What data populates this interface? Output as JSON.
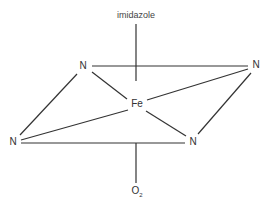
{
  "diagram": {
    "labels": {
      "top_ligand": "imidazole",
      "center": "Fe",
      "n_top_left": "N",
      "n_top_right": "N",
      "n_bottom_left": "N",
      "n_bottom_right": "N",
      "bottom_ligand_base": "O",
      "bottom_ligand_sub": "2"
    },
    "line_color": "#333333"
  }
}
